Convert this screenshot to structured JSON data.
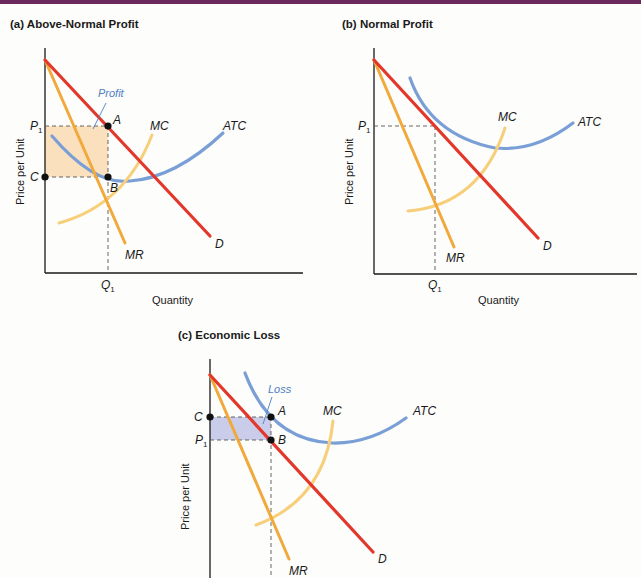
{
  "colors": {
    "demand": "#e2372a",
    "mr": "#f2a93b",
    "mc": "#f7cf7a",
    "atc": "#7a9fd6",
    "profit_fill": "#fbe0bd",
    "loss_fill": "#c9cdea",
    "axis": "#1a1a1a",
    "annotation": "#4f7fc4",
    "top_band": "#6b2a5e"
  },
  "panels": [
    {
      "id": "a",
      "title": "(a) Above-Normal Profit",
      "y_axis_label": "Price per Unit",
      "x_axis_label": "Quantity",
      "labels": {
        "P": "P",
        "P_sub": "1",
        "C": "C",
        "Q": "Q",
        "Q_sub": "1",
        "A": "A",
        "B": "B",
        "MC": "MC",
        "ATC": "ATC",
        "MR": "MR",
        "D": "D"
      },
      "area_label": "Profit"
    },
    {
      "id": "b",
      "title": "(b) Normal Profit",
      "y_axis_label": "Price per Unit",
      "x_axis_label": "Quantity",
      "labels": {
        "P": "P",
        "P_sub": "1",
        "Q": "Q",
        "Q_sub": "1",
        "MC": "MC",
        "ATC": "ATC",
        "MR": "MR",
        "D": "D"
      }
    },
    {
      "id": "c",
      "title": "(c) Economic Loss",
      "y_axis_label": "Price per Unit",
      "labels": {
        "P": "P",
        "P_sub": "1",
        "C": "C",
        "A": "A",
        "B": "B",
        "MC": "MC",
        "ATC": "ATC",
        "MR": "MR",
        "D": "D"
      },
      "area_label": "Loss"
    }
  ]
}
